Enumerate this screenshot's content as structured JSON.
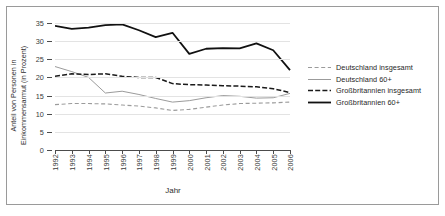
{
  "chart_data": {
    "type": "line",
    "title": "",
    "xlabel": "Jahr",
    "ylabel": "Anteil von Personen in Einkommensarmut (in Prozent)",
    "categories": [
      "1992",
      "1993",
      "1994",
      "1995",
      "1996",
      "1997",
      "1998",
      "1999",
      "2000",
      "2001",
      "2002",
      "2003",
      "2004",
      "2005",
      "2006"
    ],
    "x": [
      1992,
      1993,
      1994,
      1995,
      1996,
      1997,
      1998,
      1999,
      2000,
      2001,
      2002,
      2003,
      2004,
      2005,
      2006
    ],
    "ylim": [
      0,
      35
    ],
    "yticks": [
      0,
      5,
      10,
      15,
      20,
      25,
      30,
      35
    ],
    "ytick_labels": [
      "0",
      "5",
      "10",
      "15",
      "20",
      "25",
      "30",
      "35"
    ],
    "grid": true,
    "legend_position": "right",
    "series": [
      {
        "name": "Deutschland insgesamt",
        "style": "dashed",
        "color": "#9b9b9b",
        "values": [
          12.5,
          12.8,
          12.8,
          12.7,
          12.4,
          12.1,
          11.6,
          10.9,
          11.2,
          11.8,
          12.4,
          12.8,
          12.9,
          13.0,
          13.2
        ]
      },
      {
        "name": "Deutschland 60+",
        "style": "solid",
        "color": "#9b9b9b",
        "values": [
          23.0,
          21.6,
          20.0,
          15.7,
          16.2,
          15.3,
          14.2,
          13.2,
          13.6,
          14.4,
          15.0,
          14.8,
          14.3,
          14.4,
          15.6
        ]
      },
      {
        "name": "Großbritannien insgesamt",
        "style": "dash-dot",
        "color": "#1a1a1a",
        "values": [
          20.3,
          21.0,
          20.8,
          21.0,
          20.3,
          20.0,
          20.0,
          18.3,
          18.0,
          17.9,
          17.7,
          17.6,
          17.4,
          16.9,
          15.8
        ]
      },
      {
        "name": "Großbritannien 60+",
        "style": "solid-bold",
        "color": "#111111",
        "values": [
          34.2,
          33.4,
          33.7,
          34.4,
          34.6,
          33.0,
          31.1,
          32.3,
          26.5,
          27.9,
          28.1,
          28.0,
          29.4,
          27.5,
          22.0
        ]
      }
    ]
  }
}
